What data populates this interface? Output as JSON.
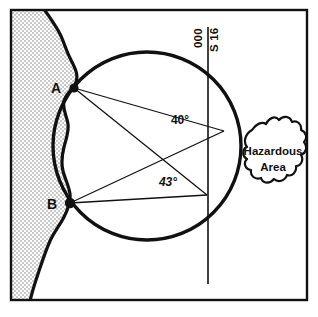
{
  "figure": {
    "type": "navigation-chart-diagram",
    "frame": {
      "border_color": "#000000",
      "background_color": "#ffffff"
    },
    "land": {
      "name": "coastline-landmass",
      "fill_color": "#d8d8d8",
      "outline_color": "#000000",
      "side": "left"
    },
    "circle": {
      "name": "position-circle",
      "stroke_color": "#000000",
      "center_x": 147,
      "center_y": 146,
      "radius": 94
    },
    "bearing_line": {
      "name": "bearing-line",
      "stroke_color": "#000000",
      "x": 208,
      "y_top": 27,
      "y_bottom": 284
    },
    "points": [
      {
        "id": "A",
        "label": "A",
        "x": 74,
        "y": 88,
        "label_x": 56,
        "label_y": 91
      },
      {
        "id": "B",
        "label": "B",
        "x": 70,
        "y": 203,
        "label_x": 52,
        "label_y": 207
      }
    ],
    "vertices": [
      {
        "id": "V1",
        "x": 224,
        "y": 131
      },
      {
        "id": "V2",
        "x": 207,
        "y": 195
      }
    ],
    "angles": [
      {
        "id": "angle-40",
        "label": "40°",
        "value": 40,
        "unit": "degrees",
        "x": 180,
        "y": 124,
        "style": "upright"
      },
      {
        "id": "angle-43",
        "label": "43°",
        "value": 43,
        "unit": "degrees",
        "x": 168,
        "y": 186,
        "style": "italic"
      }
    ],
    "bearing_labels": [
      {
        "id": "bearing-000",
        "text": "000",
        "x": 202,
        "y": 48,
        "rotation": -90,
        "side": "left"
      },
      {
        "id": "bearing-s16",
        "text": "S 16",
        "x": 218,
        "y": 50,
        "rotation": -90,
        "side": "right"
      }
    ],
    "hazard": {
      "name": "hazardous-area",
      "label_line1": "Hazardous",
      "label_line2": "Area",
      "fill_color": "#ffffff",
      "outline_color": "#000000",
      "label_x": 273,
      "label_y1": 155,
      "label_y2": 171
    }
  }
}
